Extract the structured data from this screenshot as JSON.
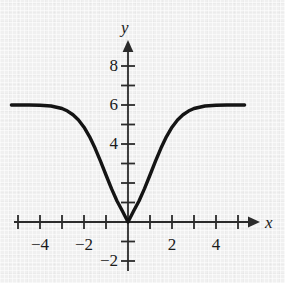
{
  "chart_data": {
    "type": "line",
    "title": "",
    "xlabel": "x",
    "ylabel": "y",
    "xlim": [
      -5.6,
      5.6
    ],
    "ylim": [
      -2.6,
      9.0
    ],
    "grid": false,
    "legend": null,
    "axis_style": "cartesian-arrows",
    "x_tick_step": 1,
    "y_tick_step": 1,
    "x_ticks": [
      -5,
      -4,
      -3,
      -2,
      -1,
      1,
      2,
      3,
      4,
      5
    ],
    "y_ticks": [
      -2,
      -1,
      1,
      2,
      3,
      4,
      5,
      6,
      7,
      8
    ],
    "x_tick_labels": [
      {
        "value": -4,
        "text": "−4"
      },
      {
        "value": -2,
        "text": "−2"
      },
      {
        "value": 2,
        "text": "2"
      },
      {
        "value": 4,
        "text": "4"
      }
    ],
    "y_tick_labels": [
      {
        "value": 8,
        "text": "8"
      },
      {
        "value": 6,
        "text": "6"
      },
      {
        "value": 4,
        "text": "4"
      },
      {
        "value": -2,
        "text": "−2"
      }
    ],
    "series": [
      {
        "name": "curve",
        "color": "#141414",
        "line_width": 3.4,
        "description": "Gaussian well: asymptotes to y = 6 on both sides, dips to a minimum of y = 0 at x = 0",
        "asymptote_y": 6,
        "minimum": {
          "x": 0,
          "y": 0
        },
        "x": [
          -5.3,
          -5.0,
          -4.5,
          -4.0,
          -3.5,
          -3.0,
          -2.75,
          -2.5,
          -2.25,
          -2.0,
          -1.75,
          -1.5,
          -1.25,
          -1.0,
          -0.75,
          -0.5,
          -0.25,
          0,
          0.25,
          0.5,
          0.75,
          1.0,
          1.25,
          1.5,
          1.75,
          2.0,
          2.25,
          2.5,
          2.75,
          3.0,
          3.5,
          4.0,
          4.5,
          5.0,
          5.3
        ],
        "y": [
          6.0,
          6.0,
          6.0,
          5.99,
          5.95,
          5.82,
          5.69,
          5.5,
          5.23,
          4.86,
          4.38,
          3.79,
          3.12,
          2.41,
          1.71,
          1.08,
          0.55,
          0.0,
          0.55,
          1.08,
          1.71,
          2.41,
          3.12,
          3.79,
          4.38,
          4.86,
          5.23,
          5.5,
          5.69,
          5.82,
          5.95,
          5.99,
          6.0,
          6.0,
          6.0
        ]
      }
    ],
    "axis_labels": {
      "x_axis_name": "x",
      "y_axis_name": "y"
    }
  },
  "colors": {
    "background": "#f0f0f0",
    "axis": "#2b2b2b",
    "curve": "#141414",
    "text": "#1a1a1a"
  }
}
